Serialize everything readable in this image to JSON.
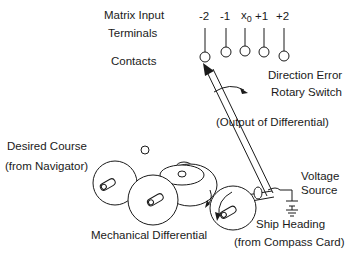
{
  "diagram": {
    "type": "mechanical-schematic"
  },
  "labels": {
    "matrix_input": "Matrix Input",
    "terminals": "Terminals",
    "contacts": "Contacts",
    "direction_error": "Direction Error",
    "rotary_switch": "Rotary Switch",
    "output_of_differential": "(Output of Differential)",
    "desired_course": "Desired Course",
    "from_navigator": "(from Navigator)",
    "voltage": "Voltage",
    "source": "Source",
    "mechanical_differential": "Mechanical Differential",
    "ship_heading": "Ship Heading",
    "from_compass_card": "(from Compass Card)"
  },
  "terminals": [
    {
      "label": "-2",
      "x": 205
    },
    {
      "label": "-1",
      "x": 226
    },
    {
      "label": "x",
      "sub": "0",
      "x": 245
    },
    {
      "label": "+1",
      "x": 264
    },
    {
      "label": "+2",
      "x": 284
    }
  ],
  "colors": {
    "ink": "#1a1a1a",
    "background": "#ffffff"
  }
}
